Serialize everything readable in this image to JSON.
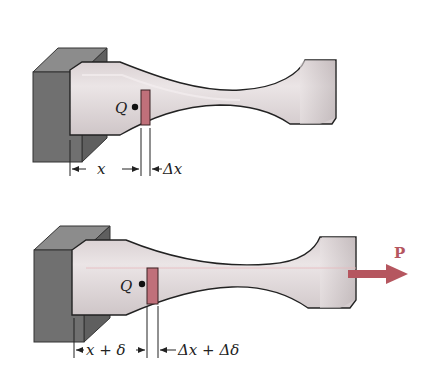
{
  "figure": {
    "top_panel": {
      "point_label": "Q",
      "dim_x_label": "x",
      "dim_dx_label": "Δx"
    },
    "bottom_panel": {
      "point_label": "Q",
      "dim_x_label": "x + δ",
      "dim_dx_label": "Δx + Δδ",
      "load_label": "P"
    },
    "colors": {
      "specimen": "#e2dbdc",
      "specimen_shade": "#cdc4c6",
      "support": "#6f6f6f",
      "support_top": "#8a8a8a",
      "element": "#c0707a",
      "load_arrow": "#b5565f",
      "outline": "#222222"
    }
  }
}
